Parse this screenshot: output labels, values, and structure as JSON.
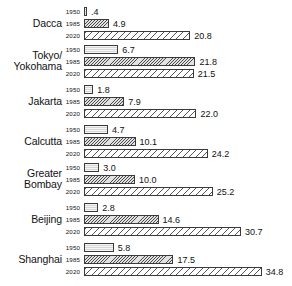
{
  "chart_data": {
    "type": "bar",
    "orientation": "horizontal",
    "title": "",
    "subtitle": "",
    "xlabel": "",
    "ylabel": "",
    "grid": false,
    "legend": "none",
    "xlim": [
      0,
      34.8
    ],
    "categories": [
      "Dacca",
      "Tokyo/Yokohama",
      "Jakarta",
      "Calcutta",
      "Greater Bombay",
      "Beijing",
      "Shanghai"
    ],
    "series": [
      {
        "name": "1950",
        "values": [
          0.4,
          6.7,
          1.8,
          4.7,
          3.0,
          2.8,
          5.8
        ]
      },
      {
        "name": "1985",
        "values": [
          4.9,
          21.8,
          7.9,
          10.1,
          10.0,
          14.6,
          17.5
        ]
      },
      {
        "name": "2020",
        "values": [
          20.8,
          21.5,
          22.0,
          24.2,
          25.2,
          30.7,
          34.8
        ]
      }
    ],
    "year_labels": [
      "1950",
      "1985",
      "2020"
    ],
    "groups": [
      {
        "name": "Dacca",
        "label_line1": "Dacca",
        "label_line2": "",
        "rows": [
          {
            "year": "1950",
            "value": 0.4,
            "value_label": ".4"
          },
          {
            "year": "1985",
            "value": 4.9,
            "value_label": "4.9"
          },
          {
            "year": "2020",
            "value": 20.8,
            "value_label": "20.8"
          }
        ]
      },
      {
        "name": "Tokyo/Yokohama",
        "label_line1": "Tokyo/",
        "label_line2": "Yokohama",
        "rows": [
          {
            "year": "1950",
            "value": 6.7,
            "value_label": "6.7"
          },
          {
            "year": "1985",
            "value": 21.8,
            "value_label": "21.8"
          },
          {
            "year": "2020",
            "value": 21.5,
            "value_label": "21.5"
          }
        ]
      },
      {
        "name": "Jakarta",
        "label_line1": "Jakarta",
        "label_line2": "",
        "rows": [
          {
            "year": "1950",
            "value": 1.8,
            "value_label": "1.8"
          },
          {
            "year": "1985",
            "value": 7.9,
            "value_label": "7.9"
          },
          {
            "year": "2020",
            "value": 22.0,
            "value_label": "22.0"
          }
        ]
      },
      {
        "name": "Calcutta",
        "label_line1": "Calcutta",
        "label_line2": "",
        "rows": [
          {
            "year": "1950",
            "value": 4.7,
            "value_label": "4.7"
          },
          {
            "year": "1985",
            "value": 10.1,
            "value_label": "10.1"
          },
          {
            "year": "2020",
            "value": 24.2,
            "value_label": "24.2"
          }
        ]
      },
      {
        "name": "Greater Bombay",
        "label_line1": "Greater",
        "label_line2": "Bombay",
        "rows": [
          {
            "year": "1950",
            "value": 3.0,
            "value_label": "3.0"
          },
          {
            "year": "1985",
            "value": 10.0,
            "value_label": "10.0"
          },
          {
            "year": "2020",
            "value": 25.2,
            "value_label": "25.2"
          }
        ]
      },
      {
        "name": "Beijing",
        "label_line1": "Beijing",
        "label_line2": "",
        "rows": [
          {
            "year": "1950",
            "value": 2.8,
            "value_label": "2.8"
          },
          {
            "year": "1985",
            "value": 14.6,
            "value_label": "14.6"
          },
          {
            "year": "2020",
            "value": 30.7,
            "value_label": "30.7"
          }
        ]
      },
      {
        "name": "Shanghai",
        "label_line1": "Shanghai",
        "label_line2": "",
        "rows": [
          {
            "year": "1950",
            "value": 5.8,
            "value_label": "5.8"
          },
          {
            "year": "1985",
            "value": 17.5,
            "value_label": "17.5"
          },
          {
            "year": "2020",
            "value": 34.8,
            "value_label": "34.8"
          }
        ]
      }
    ]
  },
  "style": {
    "bar_origin_x": 84,
    "px_per_unit": 5.11,
    "bar_outline": "#3a3a3a",
    "text_color": "#111111",
    "background": "#ffffff"
  }
}
